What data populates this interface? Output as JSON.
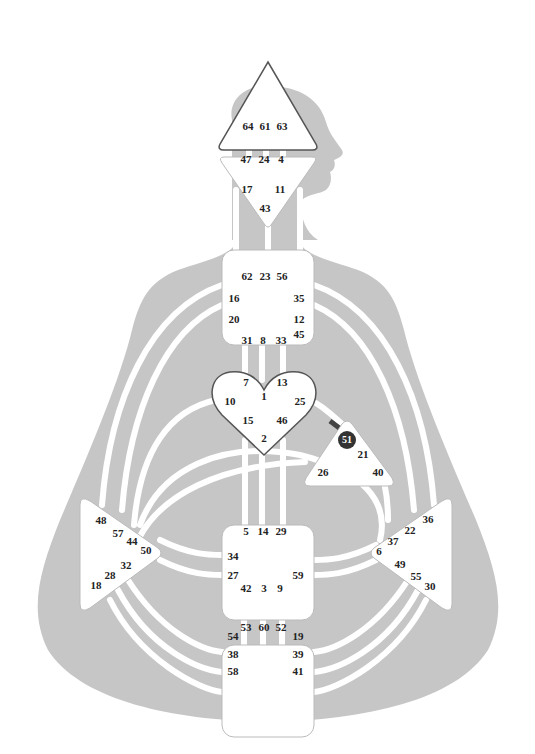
{
  "diagram": {
    "type": "Human Design Bodygraph",
    "colors": {
      "silhouette": "#c6c6c6",
      "channel": "#ffffff",
      "center_fill": "#ffffff",
      "center_border": "#555555",
      "activated_gate": "#333333",
      "background": "#ffffff"
    },
    "centers": {
      "head": {
        "name": "Head",
        "gates": [
          "64",
          "61",
          "63"
        ]
      },
      "ajna": {
        "name": "Ajna",
        "gates": [
          "47",
          "24",
          "4",
          "17",
          "11",
          "43"
        ]
      },
      "throat": {
        "name": "Throat",
        "gates": [
          "62",
          "23",
          "56",
          "16",
          "35",
          "20",
          "12",
          "45",
          "31",
          "8",
          "33"
        ]
      },
      "g": {
        "name": "G Center",
        "gates": [
          "7",
          "13",
          "1",
          "10",
          "25",
          "15",
          "46",
          "2"
        ]
      },
      "ego": {
        "name": "Heart/Ego",
        "gates": [
          "51",
          "21",
          "26",
          "40"
        ],
        "activated_gate": "51"
      },
      "spleen": {
        "name": "Spleen",
        "gates": [
          "48",
          "57",
          "44",
          "50",
          "32",
          "28",
          "18"
        ]
      },
      "solar_plexus": {
        "name": "Solar Plexus",
        "gates": [
          "36",
          "22",
          "37",
          "6",
          "49",
          "55",
          "30"
        ]
      },
      "sacral": {
        "name": "Sacral",
        "gates": [
          "5",
          "14",
          "29",
          "34",
          "27",
          "59",
          "42",
          "3",
          "9"
        ]
      },
      "root": {
        "name": "Root",
        "gates": [
          "53",
          "60",
          "52",
          "54",
          "19",
          "38",
          "39",
          "58",
          "41"
        ]
      }
    }
  }
}
